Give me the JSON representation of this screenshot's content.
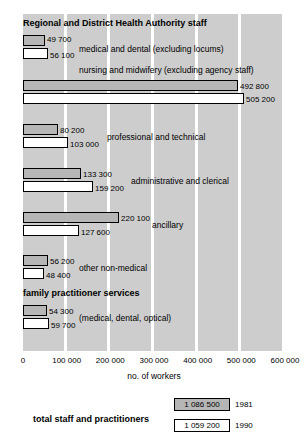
{
  "chart_data": {
    "type": "bar",
    "title": "",
    "xlabel": "no. of workers",
    "ylabel": "",
    "orientation": "horizontal",
    "xlim": [
      0,
      600000
    ],
    "grid": true,
    "legend_position": "bottom-right",
    "tick_labels": [
      "0",
      "100 000",
      "200 000",
      "300 000",
      "400 000",
      "500 000",
      "600 000"
    ],
    "tick_values": [
      0,
      100000,
      200000,
      300000,
      400000,
      500000,
      600000
    ],
    "series": [
      {
        "name": "1981",
        "style": "grey-filled"
      },
      {
        "name": "1990",
        "style": "white-filled"
      }
    ],
    "groups": [
      {
        "heading": "Regional and District Health Authority staff",
        "categories": [
          {
            "label": "medical and dental (excluding locums)",
            "values": [
              49700,
              56100
            ],
            "value_labels": [
              "49 700",
              "56 100"
            ]
          },
          {
            "label": "nursing and midwifery (excluding agency staff)",
            "values": [
              492800,
              505200
            ],
            "value_labels": [
              "492 800",
              "505 200"
            ]
          },
          {
            "label": "professional and technical",
            "values": [
              80200,
              103000
            ],
            "value_labels": [
              "80 200",
              "103 000"
            ]
          },
          {
            "label": "administrative and clerical",
            "values": [
              133300,
              159200
            ],
            "value_labels": [
              "133 300",
              "159 200"
            ]
          },
          {
            "label": "ancillary",
            "values": [
              220100,
              127600
            ],
            "value_labels": [
              "220 100",
              "127 600"
            ]
          },
          {
            "label": "other non-medical",
            "values": [
              56200,
              48400
            ],
            "value_labels": [
              "56 200",
              "48 400"
            ]
          }
        ]
      },
      {
        "heading": "family practitioner services",
        "categories": [
          {
            "label": "(medical, dental, optical)",
            "values": [
              54300,
              59700
            ],
            "value_labels": [
              "54 300",
              "59 700"
            ]
          }
        ]
      }
    ],
    "totals": {
      "label": "total staff and practitioners",
      "rows": [
        {
          "year": "1981",
          "value": 1086500,
          "value_label": "1 086 500"
        },
        {
          "year": "1990",
          "value": 1059200,
          "value_label": "1 059 200"
        }
      ]
    }
  },
  "colors": {
    "band": "#cdcdcd",
    "bar_1981": "#b6b6b6",
    "bar_1990": "#ffffff",
    "outline": "#000000",
    "page_background": "#ffffff"
  }
}
